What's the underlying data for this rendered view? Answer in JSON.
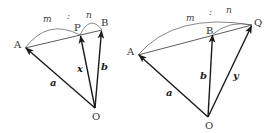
{
  "figures": [
    {
      "name": "internal-division",
      "points": {
        "A": {
          "label": "A",
          "x": 25,
          "y": 48
        },
        "P": {
          "label": "P",
          "x": 80,
          "y": 35
        },
        "B": {
          "label": "B",
          "x": 102,
          "y": 30
        },
        "O": {
          "label": "O",
          "x": 95,
          "y": 108
        }
      },
      "vectors": {
        "a": "a",
        "x": "x",
        "b": "b"
      },
      "ratio": {
        "m": "m",
        "sep": ":",
        "n": "n"
      }
    },
    {
      "name": "external-division",
      "points": {
        "A": {
          "label": "A",
          "x": 138,
          "y": 55
        },
        "B": {
          "label": "B",
          "x": 213,
          "y": 34
        },
        "Q": {
          "label": "Q",
          "x": 252,
          "y": 25
        },
        "O": {
          "label": "O",
          "x": 208,
          "y": 117
        }
      },
      "vectors": {
        "a": "a",
        "b": "b",
        "y": "y"
      },
      "ratio": {
        "m": "m",
        "sep": ":",
        "n": "n"
      }
    }
  ],
  "colors": {
    "stroke": "#1a1a1a",
    "arc": "#555555"
  }
}
